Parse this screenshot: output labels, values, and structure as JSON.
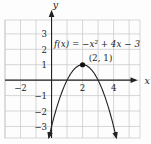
{
  "figure": {
    "background": "#fdfdfd",
    "grid_color": "#c6c6c6",
    "axis_color": "#222222",
    "curve_color": "#222222",
    "text_color": "#222222",
    "point_color": "#111111"
  },
  "chart_data": {
    "type": "line",
    "title": "",
    "function_label": "f(x) = −x² + 4x − 3",
    "equation": {
      "a": -1,
      "b": 4,
      "c": -3
    },
    "vertex_point": {
      "x": 2,
      "y": 1,
      "label": "(2, 1)"
    },
    "xlabel": "x",
    "ylabel": "y",
    "x_tick_labels": [
      -2,
      2,
      4
    ],
    "y_tick_labels": [
      3,
      2,
      1,
      -1,
      -2,
      -3
    ],
    "xlim": [
      -3,
      5.7
    ],
    "ylim": [
      -3.75,
      3.9
    ],
    "grid": true,
    "gridline_step": 1,
    "legend": "none"
  }
}
